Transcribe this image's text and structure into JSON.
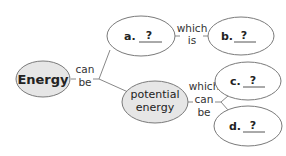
{
  "diagram": {
    "type": "concept-map",
    "colors": {
      "filled_node": "#e6e6e6",
      "empty_node": "#ffffff",
      "stroke": "#7a7a7a",
      "line": "#888888",
      "text": "#222222",
      "blank_underline": "#555555"
    },
    "nodes": {
      "energy": {
        "label": "Energy"
      },
      "a": {
        "prefix": "a.",
        "blank": "?"
      },
      "b": {
        "prefix": "b.",
        "blank": "?"
      },
      "potential": {
        "line1": "potential",
        "line2": "energy"
      },
      "c": {
        "prefix": "c.",
        "blank": "?"
      },
      "d": {
        "prefix": "d.",
        "blank": "?"
      }
    },
    "links": {
      "can_be": {
        "line1": "can",
        "line2": "be"
      },
      "which_is": {
        "line1": "which",
        "line2": "is"
      },
      "which_can_be": {
        "line1": "which",
        "line2": "can",
        "line3": "be"
      }
    }
  }
}
